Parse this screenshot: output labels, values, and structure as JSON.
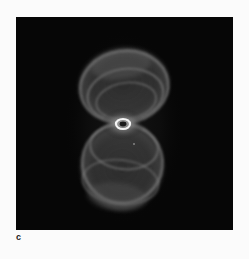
{
  "figure": {
    "panel_label": "c",
    "image": {
      "subject": "hourglass-shaped planetary nebula",
      "description": "Grayscale astronomical image of a bipolar nebula with an upper and lower lobe of glowing rings and a bright elliptical ring at the center, on a black background",
      "colors": {
        "background": "#060606",
        "nebula_glow": "#8a8a8a",
        "central_ring": "#f4f4f4"
      }
    }
  }
}
